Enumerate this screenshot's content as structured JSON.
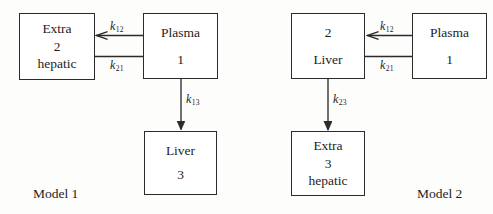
{
  "figure": {
    "background_color": "#fdfdfc",
    "line_color": "#2b2b2b",
    "text_color": "#1d1d1d"
  },
  "models": [
    {
      "id": "model-1",
      "caption": "Model 1",
      "boxes": [
        {
          "id": "extrahepatic-2",
          "lines": [
            "Extra",
            "2",
            "hepatic"
          ]
        },
        {
          "id": "plasma-1",
          "lines": [
            "Plasma",
            "1"
          ]
        },
        {
          "id": "liver-3",
          "lines": [
            "Liver",
            "3"
          ]
        }
      ],
      "rates": [
        {
          "id": "k12",
          "base": "k",
          "sub": "12"
        },
        {
          "id": "k21",
          "base": "k",
          "sub": "21"
        },
        {
          "id": "k13",
          "base": "k",
          "sub": "13"
        }
      ]
    },
    {
      "id": "model-2",
      "caption": "Model 2",
      "boxes": [
        {
          "id": "liver-2",
          "lines": [
            "2",
            "Liver"
          ]
        },
        {
          "id": "plasma-1",
          "lines": [
            "Plasma",
            "1"
          ]
        },
        {
          "id": "extrahepatic-3",
          "lines": [
            "Extra",
            "3",
            "hepatic"
          ]
        }
      ],
      "rates": [
        {
          "id": "k12",
          "base": "k",
          "sub": "12"
        },
        {
          "id": "k21",
          "base": "k",
          "sub": "21"
        },
        {
          "id": "k23",
          "base": "k",
          "sub": "23"
        }
      ]
    }
  ]
}
